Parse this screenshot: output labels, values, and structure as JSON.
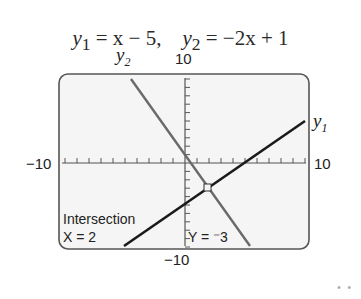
{
  "title": {
    "eq1_lhs": "y",
    "eq1_sub": "1",
    "eq1_rhs": " = x − 5,",
    "eq2_lhs": "y",
    "eq2_sub": "2",
    "eq2_rhs": " = −2x + 1"
  },
  "labels": {
    "y2": "y",
    "y2_sub": "2",
    "y1": "y",
    "y1_sub": "1",
    "ymax": "10",
    "ymin": "−10",
    "xmin": "−10",
    "xmax": "10",
    "intersection": "Intersection",
    "x_readout": "X = 2",
    "y_readout": "Y = ⁻3"
  },
  "decor": {
    "dots": "• •"
  },
  "chart_data": {
    "type": "line",
    "xlim": [
      -10,
      10
    ],
    "ylim": [
      -10,
      10
    ],
    "xscale": 1,
    "yscale": 1,
    "grid": false,
    "series": [
      {
        "name": "y1",
        "expression": "x - 5",
        "x": [
          -5.3,
          9.4
        ],
        "y": [
          -10.3,
          4.4
        ]
      },
      {
        "name": "y2",
        "expression": "-2x + 1",
        "x": [
          -4.4,
          5.5
        ],
        "y": [
          9.8,
          -10
        ]
      }
    ],
    "annotations": [
      {
        "text": "Intersection",
        "point": [
          2,
          -3
        ]
      },
      {
        "text": "X = 2"
      },
      {
        "text": "Y = -3"
      }
    ],
    "intersection": {
      "x": 2,
      "y": -3
    }
  }
}
